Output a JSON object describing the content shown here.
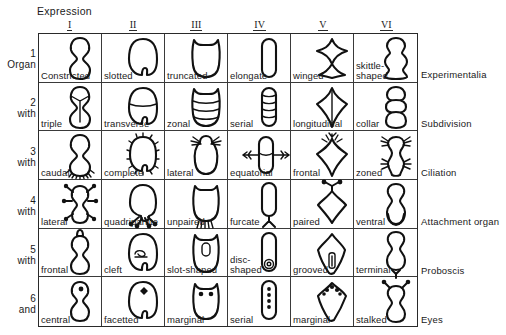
{
  "figure": {
    "title": "Expression",
    "columns": [
      "I",
      "II",
      "III",
      "IV",
      "V",
      "VI"
    ],
    "row_stubs": [
      {
        "num": "1",
        "word": "Organ"
      },
      {
        "num": "2",
        "word": "with"
      },
      {
        "num": "3",
        "word": "with"
      },
      {
        "num": "4",
        "word": "with"
      },
      {
        "num": "5",
        "word": "with"
      },
      {
        "num": "6",
        "word": "and"
      }
    ],
    "row_categories": [
      "Experimentalia",
      "Subdivision",
      "Ciliation",
      "Attachment organ",
      "Proboscis",
      "Eyes"
    ],
    "rows": [
      {
        "category": "Experimentalia",
        "cells": [
          {
            "label": "Constricted",
            "shape": "constricted"
          },
          {
            "label": "slotted",
            "shape": "slotted"
          },
          {
            "label": "truncated",
            "shape": "truncated"
          },
          {
            "label": "elongate",
            "shape": "elongate"
          },
          {
            "label": "winged",
            "shape": "winged"
          },
          {
            "label": "skittle-\nshaped",
            "shape": "skittle"
          }
        ]
      },
      {
        "category": "Subdivision",
        "cells": [
          {
            "label": "triple",
            "shape": "triple"
          },
          {
            "label": "transverse",
            "shape": "transverse"
          },
          {
            "label": "zonal",
            "shape": "zonal"
          },
          {
            "label": "serial",
            "shape": "serial"
          },
          {
            "label": "longitudinal",
            "shape": "longitudinal"
          },
          {
            "label": "collar",
            "shape": "collar"
          }
        ]
      },
      {
        "category": "Ciliation",
        "cells": [
          {
            "label": "caudal",
            "shape": "caudal"
          },
          {
            "label": "complete",
            "shape": "complete"
          },
          {
            "label": "lateral",
            "shape": "lateral-cil"
          },
          {
            "label": "equatorial",
            "shape": "equatorial"
          },
          {
            "label": "frontal",
            "shape": "frontal-cil"
          },
          {
            "label": "zoned",
            "shape": "zoned"
          }
        ]
      },
      {
        "category": "Attachment organ",
        "cells": [
          {
            "label": "lateral",
            "shape": "lateral-att"
          },
          {
            "label": "quadripartite",
            "shape": "quadripartite"
          },
          {
            "label": "unpaired",
            "shape": "unpaired"
          },
          {
            "label": "furcate",
            "shape": "furcate"
          },
          {
            "label": "paired",
            "shape": "paired"
          },
          {
            "label": "ventral",
            "shape": "ventral"
          }
        ]
      },
      {
        "category": "Proboscis",
        "cells": [
          {
            "label": "frontal",
            "shape": "frontal-pro"
          },
          {
            "label": "cleft",
            "shape": "cleft"
          },
          {
            "label": "slot-shaped",
            "shape": "slot-shaped"
          },
          {
            "label": "disc-\nshaped",
            "shape": "disc-shaped"
          },
          {
            "label": "grooved",
            "shape": "grooved"
          },
          {
            "label": "terminal",
            "shape": "terminal"
          }
        ]
      },
      {
        "category": "Eyes",
        "cells": [
          {
            "label": "central",
            "shape": "central"
          },
          {
            "label": "facetted",
            "shape": "facetted"
          },
          {
            "label": "marginal",
            "shape": "marginal-eye"
          },
          {
            "label": "serial",
            "shape": "serial-eye"
          },
          {
            "label": "marginal",
            "shape": "marginal-eye2"
          },
          {
            "label": "stalked",
            "shape": "stalked"
          }
        ]
      }
    ]
  }
}
